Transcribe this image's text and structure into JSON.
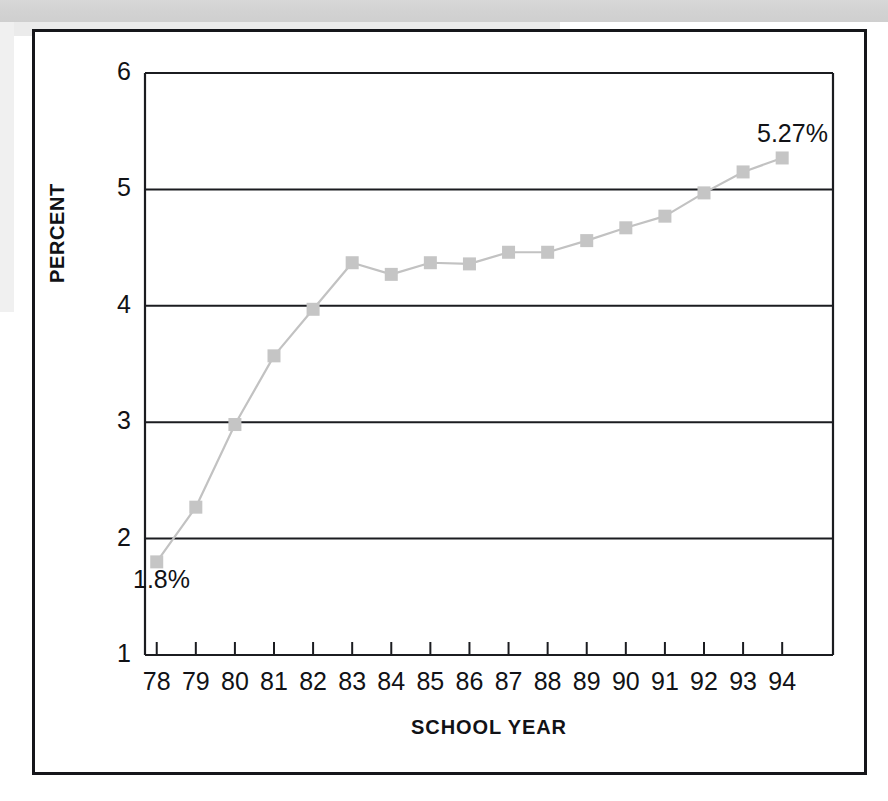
{
  "figure": {
    "border_color": "#15161a",
    "background": "#ffffff"
  },
  "chart_data": {
    "type": "line",
    "title": "",
    "subtitle": "",
    "xlabel": "SCHOOL YEAR",
    "ylabel": "PERCENT",
    "categories": [
      "78",
      "79",
      "80",
      "81",
      "82",
      "83",
      "84",
      "85",
      "86",
      "87",
      "88",
      "89",
      "90",
      "91",
      "92",
      "93",
      "94"
    ],
    "values": [
      1.8,
      2.27,
      2.98,
      3.57,
      3.97,
      4.37,
      4.27,
      4.37,
      4.36,
      4.46,
      4.46,
      4.56,
      4.67,
      4.77,
      4.97,
      5.15,
      5.27
    ],
    "ylim": [
      1,
      6
    ],
    "y_ticks": [
      "1",
      "2",
      "3",
      "4",
      "5",
      "6"
    ],
    "y_tick_values": [
      1,
      2,
      3,
      4,
      5,
      6
    ],
    "x_ticks": [
      "78",
      "79",
      "80",
      "81",
      "82",
      "83",
      "84",
      "85",
      "86",
      "87",
      "88",
      "89",
      "90",
      "91",
      "92",
      "93",
      "94"
    ],
    "grid": "horizontal",
    "legend": "none",
    "marker": "square",
    "marker_color": "#c5c5c5",
    "line_color": "#c2c2c2",
    "annotations": [
      {
        "text": "1.8%",
        "category": "78",
        "value": 1.8,
        "position": "below-right"
      },
      {
        "text": "5.27%",
        "category": "94",
        "value": 5.27,
        "position": "above-left"
      }
    ]
  },
  "axis_titles": {
    "y": "PERCENT",
    "x": "SCHOOL YEAR"
  },
  "callouts": {
    "first": "1.8%",
    "last": "5.27%"
  }
}
